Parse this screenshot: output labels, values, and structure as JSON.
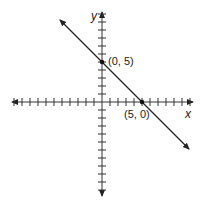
{
  "diagram": {
    "title": "",
    "x_axis_label": "x",
    "y_axis_label": "y",
    "points": [
      {
        "label": "(0, 5)",
        "x": 0,
        "y": 5
      },
      {
        "label": "(5, 0)",
        "x": 5,
        "y": 0
      }
    ],
    "line": {
      "equation": "x + y = 5",
      "slope": -1,
      "intercept": 5
    },
    "tick_range": {
      "x": [
        -11,
        11
      ],
      "y": [
        -11,
        11
      ]
    }
  }
}
